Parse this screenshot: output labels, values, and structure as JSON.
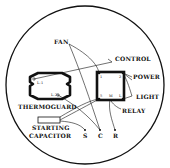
{
  "diagram": {
    "labels": {
      "fan": "FAN",
      "control": "CONTROL",
      "power": "POWER",
      "light": "LIGHT",
      "relay": "RELAY",
      "thermoguard": "THERMOGUARD",
      "starting_capacitor_line1": "STARTING",
      "starting_capacitor_line2": "CAPACITOR",
      "terminal_s": "S",
      "terminal_c": "C",
      "terminal_r": "R",
      "thermo_l1": "L-1",
      "thermo_l2": "L-2",
      "relay_t1": "1",
      "relay_t2": "2",
      "relay_t5": "5",
      "relay_tm": "M",
      "relay_tl": "L"
    },
    "colors": {
      "ink": "#111111",
      "background": "#ffffff"
    }
  }
}
